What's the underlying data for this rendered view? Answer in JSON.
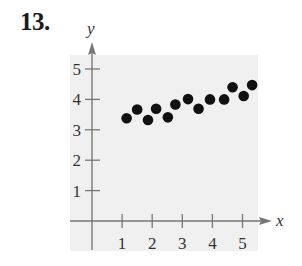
{
  "problem": {
    "number": "13."
  },
  "chart_data": {
    "type": "scatter",
    "title": "",
    "xlabel": "x",
    "ylabel": "y",
    "xlim": [
      -0.7,
      5.5
    ],
    "ylim": [
      -0.95,
      5.5
    ],
    "x_ticks": [
      1,
      2,
      3,
      4,
      5
    ],
    "y_ticks": [
      1,
      2,
      3,
      4,
      5
    ],
    "x_tick_labels": [
      "1",
      "2",
      "3",
      "4",
      "5"
    ],
    "y_tick_labels": [
      "1",
      "2",
      "3",
      "4",
      "5"
    ],
    "grid": false,
    "legend": null,
    "background": "#f0f0f0",
    "point_color": "#111111",
    "axis_color": "#777777",
    "points": [
      {
        "x": 1.15,
        "y": 3.38
      },
      {
        "x": 1.5,
        "y": 3.67
      },
      {
        "x": 1.86,
        "y": 3.32
      },
      {
        "x": 2.13,
        "y": 3.69
      },
      {
        "x": 2.52,
        "y": 3.41
      },
      {
        "x": 2.77,
        "y": 3.83
      },
      {
        "x": 3.19,
        "y": 4.01
      },
      {
        "x": 3.54,
        "y": 3.69
      },
      {
        "x": 3.92,
        "y": 4.0
      },
      {
        "x": 4.39,
        "y": 4.0
      },
      {
        "x": 4.67,
        "y": 4.4
      },
      {
        "x": 5.04,
        "y": 4.11
      },
      {
        "x": 5.32,
        "y": 4.47
      }
    ]
  }
}
